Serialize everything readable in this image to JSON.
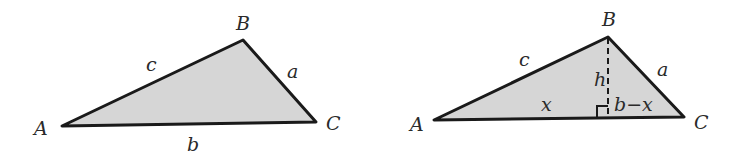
{
  "colors": {
    "fill": "#d6d6d6",
    "stroke": "#1a1a1a",
    "text": "#2a2a2a"
  },
  "left_triangle": {
    "vertices": {
      "A": "A",
      "B": "B",
      "C": "C"
    },
    "sides": {
      "a": "a",
      "b": "b",
      "c": "c"
    }
  },
  "right_triangle": {
    "vertices": {
      "A": "A",
      "B": "B",
      "C": "C"
    },
    "sides": {
      "a": "a",
      "c": "c"
    },
    "height": "h",
    "segment_left": "x",
    "segment_right": "b−x"
  }
}
